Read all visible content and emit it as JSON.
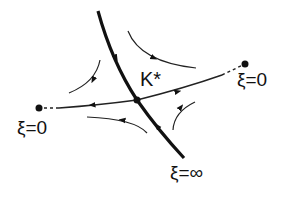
{
  "diagram": {
    "type": "phase-portrait",
    "labels": {
      "fixed_point": "K*",
      "right_endpoint": "ξ=0",
      "left_endpoint": "ξ=0",
      "bottom_endpoint": "ξ=∞"
    },
    "colors": {
      "line": "#111111",
      "background": "#ffffff"
    },
    "elements": [
      {
        "name": "stable-manifold",
        "style": "thick",
        "direction": "toward K*",
        "ends": [
          "top",
          "ξ=∞ (bottom)"
        ]
      },
      {
        "name": "unstable-manifold",
        "style": "thin",
        "direction": "away from K*",
        "ends": [
          "ξ=0 (left)",
          "ξ=0 (right)"
        ]
      },
      {
        "name": "trajectory-top-left",
        "arrow": "down"
      },
      {
        "name": "trajectory-top-right",
        "arrow": "right"
      },
      {
        "name": "trajectory-bottom-left",
        "arrow": "left"
      },
      {
        "name": "trajectory-bottom-right",
        "arrow": "up"
      }
    ]
  }
}
